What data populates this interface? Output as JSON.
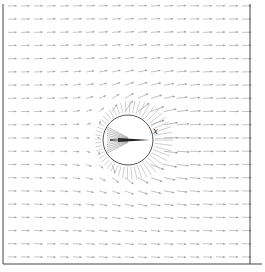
{
  "figure": {
    "type": "vector-field",
    "frame": {
      "left": 3,
      "top": 4,
      "right": 250,
      "bottom": 264
    },
    "sphere": {
      "cx": 128,
      "cy": 140,
      "r": 25,
      "stroke": "#555555"
    },
    "axis_label": "x",
    "axis_label_pos": {
      "x": 153,
      "y": 134
    },
    "arrow_color": "#8a8a8a",
    "frame_color": "#444444",
    "grid": {
      "cols": 19,
      "rows": 20,
      "x0": 8,
      "y0": 6,
      "dx": 13,
      "dy": 13.2
    }
  }
}
